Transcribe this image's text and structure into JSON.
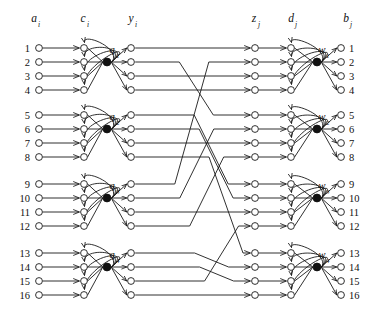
{
  "figure": {
    "background_color": "#ffffff",
    "line_color": "#1a1a1a",
    "width": 383,
    "height": 309
  },
  "column_headers": [
    {
      "name": "input-column-header",
      "symbol": "a",
      "subscript": "i",
      "x": 34,
      "y": 22
    },
    {
      "name": "c-column-header",
      "symbol": "c",
      "subscript": "i",
      "x": 83,
      "y": 22
    },
    {
      "name": "y-column-header",
      "symbol": "y",
      "subscript": "i",
      "x": 131,
      "y": 22
    },
    {
      "name": "z-column-header",
      "symbol": "z",
      "subscript": "j",
      "x": 254,
      "y": 22
    },
    {
      "name": "d-column-header",
      "symbol": "d",
      "subscript": "j",
      "x": 291,
      "y": 22
    },
    {
      "name": "output-column-header",
      "symbol": "b",
      "subscript": "j",
      "x": 346,
      "y": 22
    }
  ],
  "columns": {
    "a_x": 39,
    "c_x": 84,
    "hidden_x": 107,
    "y_x": 131,
    "z_x": 255,
    "d_x": 291,
    "hidden_right_x": 317,
    "b_x": 341
  },
  "rows": {
    "indices": [
      1,
      2,
      3,
      4,
      5,
      6,
      7,
      8,
      9,
      10,
      11,
      12,
      13,
      14,
      15,
      16
    ],
    "y_positions": [
      48,
      62,
      76,
      90,
      115,
      129,
      143,
      157,
      184,
      198,
      212,
      226,
      253,
      267,
      281,
      295
    ],
    "group_size": 4,
    "group_count": 4
  },
  "left_labels": [
    "1",
    "2",
    "3",
    "4",
    "5",
    "6",
    "7",
    "8",
    "9",
    "10",
    "11",
    "12",
    "13",
    "14",
    "15",
    "16"
  ],
  "right_labels": [
    "1",
    "2",
    "3",
    "4",
    "5",
    "6",
    "7",
    "8",
    "9",
    "10",
    "11",
    "12",
    "13",
    "14",
    "15",
    "16"
  ],
  "left_units": [
    {
      "name": "hidden-unit-q1",
      "symbol": "q",
      "subscript": "1",
      "x": 112,
      "y": 48,
      "node_y": 62
    },
    {
      "name": "hidden-unit-q2",
      "symbol": "q",
      "subscript": "2",
      "x": 112,
      "y": 115,
      "node_y": 129
    },
    {
      "name": "hidden-unit-q3",
      "symbol": "q",
      "subscript": "3",
      "x": 112,
      "y": 184,
      "node_y": 198
    },
    {
      "name": "hidden-unit-q4",
      "symbol": "q",
      "subscript": "4",
      "x": 112,
      "y": 253,
      "node_y": 267
    }
  ],
  "right_units": [
    {
      "name": "hidden-unit-w1",
      "symbol": "w",
      "subscript": "1",
      "x": 322,
      "y": 48,
      "node_y": 62
    },
    {
      "name": "hidden-unit-w2",
      "symbol": "w",
      "subscript": "2",
      "x": 322,
      "y": 115,
      "node_y": 129
    },
    {
      "name": "hidden-unit-w3",
      "symbol": "w",
      "subscript": "3",
      "x": 322,
      "y": 184,
      "node_y": 198
    },
    {
      "name": "hidden-unit-w4",
      "symbol": "w",
      "subscript": "4",
      "x": 322,
      "y": 253,
      "node_y": 267
    }
  ],
  "permutation": {
    "description": "Mapping from y-layer row index to z-layer row index",
    "pairs": [
      [
        1,
        1
      ],
      [
        2,
        5
      ],
      [
        3,
        3
      ],
      [
        4,
        4
      ],
      [
        5,
        9
      ],
      [
        6,
        10
      ],
      [
        7,
        7
      ],
      [
        8,
        13
      ],
      [
        9,
        2
      ],
      [
        10,
        6
      ],
      [
        11,
        11
      ],
      [
        12,
        8
      ],
      [
        13,
        14
      ],
      [
        14,
        15
      ],
      [
        15,
        12
      ],
      [
        16,
        16
      ]
    ]
  }
}
